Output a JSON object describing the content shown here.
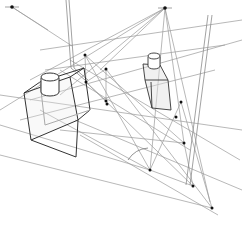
{
  "diagram": {
    "stroke_color": "#444444",
    "light_stroke_color": "#9a9a9a",
    "point_color": "#111111",
    "vanishing_points": [
      {
        "name": "vp-left",
        "x": 12,
        "y": 7
      },
      {
        "name": "vp-top-right",
        "x": 165,
        "y": 8
      }
    ],
    "points": [
      {
        "x": 85,
        "y": 55
      },
      {
        "x": 106,
        "y": 69
      },
      {
        "x": 86,
        "y": 82
      },
      {
        "x": 106,
        "y": 101
      },
      {
        "x": 107,
        "y": 104
      },
      {
        "x": 150,
        "y": 170
      },
      {
        "x": 184,
        "y": 143
      },
      {
        "x": 212,
        "y": 208
      },
      {
        "x": 193,
        "y": 186
      },
      {
        "x": 181,
        "y": 102
      },
      {
        "x": 176,
        "y": 117
      }
    ],
    "construction_lines": [
      [
        12,
        7,
        72,
        46
      ],
      [
        12,
        7,
        48,
        30
      ],
      [
        165,
        8,
        0,
        110
      ],
      [
        165,
        8,
        30,
        80
      ],
      [
        165,
        8,
        60,
        95
      ],
      [
        165,
        8,
        100,
        70
      ],
      [
        165,
        8,
        184,
        143
      ],
      [
        165,
        8,
        150,
        170
      ],
      [
        165,
        8,
        210,
        202
      ],
      [
        40,
        50,
        242,
        20
      ],
      [
        45,
        70,
        225,
        45
      ],
      [
        70,
        60,
        240,
        160
      ],
      [
        60,
        70,
        190,
        150
      ],
      [
        30,
        100,
        242,
        40
      ],
      [
        20,
        120,
        215,
        70
      ],
      [
        85,
        55,
        184,
        143
      ],
      [
        85,
        55,
        150,
        170
      ],
      [
        106,
        69,
        212,
        208
      ],
      [
        86,
        82,
        193,
        186
      ],
      [
        86,
        82,
        106,
        69
      ],
      [
        106,
        101,
        86,
        82
      ],
      [
        60,
        130,
        184,
        143
      ],
      [
        40,
        110,
        150,
        170
      ],
      [
        0,
        125,
        150,
        170
      ],
      [
        0,
        155,
        212,
        208
      ],
      [
        75,
        120,
        242,
        190
      ],
      [
        80,
        135,
        218,
        215
      ],
      [
        181,
        102,
        150,
        170
      ],
      [
        181,
        102,
        212,
        208
      ],
      [
        184,
        143,
        193,
        186
      ],
      [
        150,
        170,
        193,
        186
      ],
      [
        85,
        55,
        86,
        82
      ],
      [
        106,
        69,
        106,
        101
      ],
      [
        0,
        95,
        242,
        130
      ]
    ],
    "vertical_guides": [
      [
        66,
        0,
        71,
        68
      ],
      [
        69,
        0,
        74,
        68
      ],
      [
        71,
        68,
        85,
        80
      ],
      [
        74,
        68,
        88,
        80
      ],
      [
        208,
        15,
        186,
        185
      ],
      [
        212,
        15,
        190,
        185
      ]
    ],
    "left_box": {
      "front": [
        [
          24,
          92
        ],
        [
          70,
          75
        ],
        [
          80,
          118
        ],
        [
          31,
          140
        ]
      ],
      "back_offset": [
        0,
        0
      ],
      "top_back": [
        [
          40,
          80
        ],
        [
          84,
          66
        ]
      ],
      "bottom": [
        [
          31,
          140
        ],
        [
          76,
          157
        ],
        [
          82,
          118
        ]
      ]
    },
    "right_box": {
      "outline": [
        [
          145,
          56
        ],
        [
          164,
          67
        ],
        [
          172,
          110
        ],
        [
          152,
          110
        ],
        [
          146,
          78
        ]
      ]
    },
    "angle_arc": {
      "cx": 150,
      "cy": 170,
      "r": 28,
      "start": 200,
      "end": 250
    },
    "caption": "Perspective construction diagram"
  }
}
